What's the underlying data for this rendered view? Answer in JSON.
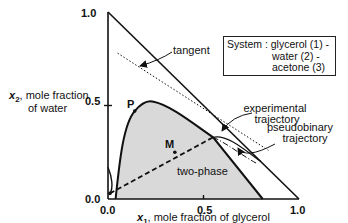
{
  "diagram": {
    "type": "ternary-phase-diagram",
    "axes": {
      "x_label_var": "x",
      "x_label_sub": "1",
      "x_label_text": ", mole fraction of glycerol",
      "y_label_var": "x",
      "y_label_sub": "2",
      "y_label_line1": ", mole fraction",
      "y_label_line2": "of water",
      "x_ticks": [
        "0.0",
        "0.5",
        "1.0"
      ],
      "y_ticks": [
        "0.0",
        "0.5",
        "1.0"
      ]
    },
    "system_box": {
      "line1": "System : glycerol (1) -",
      "line2": "water (2) -",
      "line3": "acetone (3)"
    },
    "labels": {
      "tangent": "tangent",
      "experimental": "experimental",
      "experimental2": "trajectory",
      "pseudobinary": "pseudobinary",
      "pseudobinary2": "trajectory",
      "two_phase": "two-phase",
      "point_P": "P",
      "point_M": "M"
    },
    "points": {
      "P": [
        0.14,
        0.47
      ],
      "M": [
        0.35,
        0.25
      ],
      "binodal_peak": [
        0.24,
        0.52
      ],
      "tie_line_left": [
        0.01,
        0.03
      ],
      "tie_line_right": [
        0.55,
        0.33
      ],
      "binodal_right_base": [
        0.81,
        0.0
      ],
      "tangent_start": [
        0.05,
        0.78
      ],
      "tangent_end": [
        0.84,
        0.26
      ]
    },
    "colors": {
      "two_phase_fill": "#d9d9d9",
      "line": "#111111"
    }
  }
}
